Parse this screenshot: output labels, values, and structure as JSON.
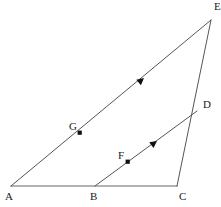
{
  "figure": {
    "background_color": "#ffffff",
    "width": 221,
    "height": 207,
    "stroke_color_diagonal": "#555555",
    "stroke_color_base": "#999999",
    "label_color": "#1a1a1a",
    "point_color": "#111111"
  },
  "points": {
    "A": {
      "label": "A",
      "x": 11,
      "y": 186,
      "label_x": 5,
      "label_y": 191
    },
    "B": {
      "label": "B",
      "x": 95,
      "y": 186,
      "label_x": 90,
      "label_y": 191
    },
    "C": {
      "label": "C",
      "x": 177,
      "y": 186,
      "label_x": 179,
      "label_y": 191
    },
    "D": {
      "label": "D",
      "x": 197,
      "y": 111,
      "label_x": 203,
      "label_y": 99
    },
    "E": {
      "label": "E",
      "x": 211,
      "y": 20,
      "label_x": 214,
      "label_y": 1
    },
    "F": {
      "label": "F",
      "x": 128,
      "y": 162,
      "label_x": 118,
      "label_y": 150
    },
    "G": {
      "label": "G",
      "x": 80,
      "y": 133,
      "label_x": 69,
      "label_y": 121
    }
  },
  "segments": [
    {
      "name": "segment-AC",
      "from": "A",
      "to": "C",
      "color": "#999999",
      "width": 1.6
    },
    {
      "name": "segment-AE",
      "from": "A",
      "to": "E",
      "color": "#555555",
      "width": 1
    },
    {
      "name": "segment-CE",
      "from": "C",
      "to": "E",
      "color": "#555555",
      "width": 1
    },
    {
      "name": "segment-BD",
      "from": "B",
      "to": "D",
      "color": "#555555",
      "width": 1
    }
  ],
  "arrow_markers": [
    {
      "name": "arrow-on-AE",
      "x": 144,
      "y": 78,
      "angle": -63,
      "on_segment": "segment-AE"
    },
    {
      "name": "arrow-on-BD",
      "x": 157,
      "y": 141,
      "angle": -63,
      "on_segment": "segment-BD"
    }
  ],
  "marked_points": [
    {
      "name": "point-G",
      "x": 80,
      "y": 133
    },
    {
      "name": "point-F",
      "x": 128,
      "y": 162
    }
  ]
}
